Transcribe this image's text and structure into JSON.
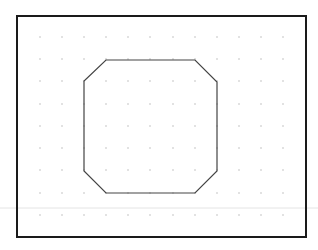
{
  "canvas": {
    "width": 318,
    "height": 250,
    "background": "#ffffff"
  },
  "frame": {
    "x": 17,
    "y": 16,
    "width": 289,
    "height": 221,
    "stroke": "#1a1a1a",
    "stroke_width": 2
  },
  "divider": {
    "y": 208,
    "x1": 0,
    "x2": 318,
    "stroke": "#e4e4e4"
  },
  "grid": {
    "dot_color": "#b0b0b0",
    "dot_radius": 0.7,
    "columns": [
      40,
      62,
      84,
      106,
      128,
      150,
      173,
      195,
      217,
      239,
      261,
      283
    ],
    "rows": [
      37,
      59,
      81,
      104,
      126,
      148,
      170,
      193,
      215
    ]
  },
  "shape": {
    "type": "octagon",
    "stroke": "#444444",
    "stroke_width": 1.2,
    "points": [
      [
        106,
        60
      ],
      [
        195,
        60
      ],
      [
        217,
        82
      ],
      [
        217,
        171
      ],
      [
        195,
        193
      ],
      [
        106,
        193
      ],
      [
        84,
        171
      ],
      [
        84,
        81
      ]
    ]
  }
}
